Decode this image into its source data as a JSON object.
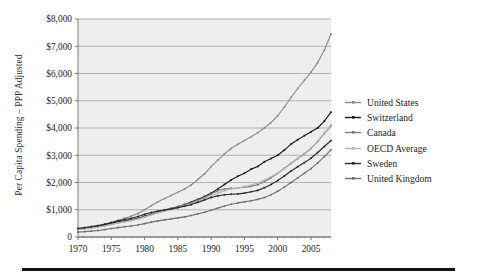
{
  "chart_data": {
    "type": "line",
    "title": "",
    "subtitle": "",
    "xlabel": "",
    "ylabel": "Per Capita Spending – PPP Adjusted",
    "xlim": [
      1970,
      2008
    ],
    "ylim": [
      0,
      8000
    ],
    "grid": true,
    "grid_axis": "y",
    "legend_position": "right",
    "y_ticks": [
      0,
      1000,
      2000,
      3000,
      4000,
      5000,
      6000,
      7000,
      8000
    ],
    "y_tick_labels": [
      "0",
      "$1,000",
      "$2,000",
      "$3,000",
      "$4,000",
      "$5,000",
      "$6,000",
      "$7,000",
      "$8,000"
    ],
    "x_ticks": [
      1970,
      1975,
      1980,
      1985,
      1990,
      1995,
      2000,
      2005
    ],
    "x_tick_labels": [
      "1970",
      "1975",
      "1980",
      "1985",
      "1990",
      "1995",
      "2000",
      "2005"
    ],
    "x": [
      1970,
      1971,
      1972,
      1973,
      1974,
      1975,
      1976,
      1977,
      1978,
      1979,
      1980,
      1981,
      1982,
      1983,
      1984,
      1985,
      1986,
      1987,
      1988,
      1989,
      1990,
      1991,
      1992,
      1993,
      1994,
      1995,
      1996,
      1997,
      1998,
      1999,
      2000,
      2001,
      2002,
      2003,
      2004,
      2005,
      2006,
      2007,
      2008
    ],
    "series": [
      {
        "name": "United States",
        "color": "#8c8c8c",
        "values": [
          320,
          350,
          385,
          420,
          470,
          540,
          610,
          690,
          765,
          860,
          1000,
          1150,
          1290,
          1410,
          1520,
          1640,
          1760,
          1910,
          2110,
          2320,
          2580,
          2820,
          3050,
          3250,
          3400,
          3540,
          3680,
          3830,
          4000,
          4200,
          4450,
          4770,
          5120,
          5450,
          5750,
          6050,
          6400,
          6850,
          7450
        ]
      },
      {
        "name": "Switzerland",
        "color": "#1a1a1a",
        "values": [
          300,
          330,
          365,
          405,
          455,
          510,
          560,
          600,
          640,
          690,
          760,
          830,
          900,
          965,
          1030,
          1110,
          1190,
          1280,
          1380,
          1490,
          1610,
          1760,
          1930,
          2090,
          2230,
          2340,
          2490,
          2590,
          2760,
          2880,
          3000,
          3190,
          3410,
          3570,
          3720,
          3860,
          4000,
          4250,
          4580
        ]
      },
      {
        "name": "Canada",
        "color": "#7d7d7d",
        "values": [
          290,
          315,
          345,
          375,
          420,
          470,
          520,
          570,
          615,
          670,
          740,
          830,
          920,
          1000,
          1060,
          1120,
          1190,
          1260,
          1350,
          1450,
          1580,
          1700,
          1760,
          1790,
          1800,
          1830,
          1860,
          1920,
          2030,
          2170,
          2340,
          2520,
          2700,
          2880,
          3050,
          3250,
          3500,
          3800,
          4080
        ]
      },
      {
        "name": "OECD Average",
        "color": "#b5b5b5",
        "values": [
          270,
          295,
          325,
          360,
          405,
          460,
          510,
          555,
          600,
          655,
          730,
          810,
          885,
          950,
          1010,
          1070,
          1130,
          1200,
          1290,
          1390,
          1500,
          1610,
          1700,
          1760,
          1800,
          1850,
          1910,
          1980,
          2090,
          2210,
          2350,
          2520,
          2710,
          2890,
          3070,
          3260,
          3500,
          3780,
          4120
        ]
      },
      {
        "name": "Sweden",
        "color": "#2b2b2b",
        "values": [
          310,
          340,
          375,
          415,
          465,
          525,
          585,
          640,
          690,
          750,
          830,
          900,
          950,
          990,
          1030,
          1080,
          1130,
          1190,
          1270,
          1360,
          1450,
          1510,
          1550,
          1570,
          1580,
          1610,
          1660,
          1710,
          1810,
          1930,
          2070,
          2240,
          2420,
          2580,
          2730,
          2890,
          3100,
          3320,
          3540
        ]
      },
      {
        "name": "United Kingdom",
        "color": "#6e6e6e",
        "values": [
          180,
          195,
          215,
          240,
          270,
          310,
          345,
          375,
          405,
          440,
          490,
          545,
          590,
          630,
          665,
          700,
          740,
          790,
          850,
          910,
          980,
          1060,
          1140,
          1200,
          1250,
          1290,
          1330,
          1380,
          1450,
          1550,
          1680,
          1830,
          2000,
          2170,
          2340,
          2510,
          2720,
          2950,
          3200
        ]
      }
    ]
  }
}
